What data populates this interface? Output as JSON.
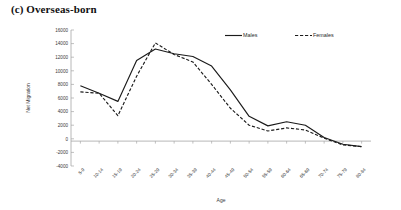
{
  "figure": {
    "title": "(c) Overseas-born",
    "background_color": "#ffffff",
    "line_color": "#1b1b1b",
    "axis_color": "#a6a6a6"
  },
  "axes": {
    "y_title": "Net Migration",
    "x_title": "Age",
    "y_ticks": [
      "16000",
      "14000",
      "12000",
      "10000",
      "8000",
      "6000",
      "4000",
      "2000",
      "0",
      "-2000",
      "-4000"
    ]
  },
  "legend": {
    "position": "top-right",
    "entries": [
      {
        "label": "Males",
        "style": "solid",
        "name": "legend-males"
      },
      {
        "label": "Females",
        "style": "dashed",
        "name": "legend-females"
      }
    ]
  },
  "chart_data": {
    "type": "line",
    "title": "(c) Overseas-born",
    "xlabel": "Age",
    "ylabel": "Net Migration",
    "ylim": [
      -4000,
      16000
    ],
    "ytick_interval": 2000,
    "grid": false,
    "legend_position": "top-right",
    "categories": [
      "5-9",
      "10-14",
      "15-19",
      "20-24",
      "25-29",
      "30-34",
      "35-39",
      "40-44",
      "45-49",
      "50-54",
      "55-59",
      "60-64",
      "65-69",
      "70-74",
      "75-79",
      "80-84"
    ],
    "series": [
      {
        "name": "Males",
        "style": "solid",
        "values": [
          7800,
          6700,
          5500,
          11500,
          13200,
          12500,
          12100,
          10700,
          7200,
          3300,
          1900,
          2500,
          2000,
          200,
          -800,
          -1150
        ]
      },
      {
        "name": "Females",
        "style": "dashed",
        "values": [
          6900,
          6700,
          3400,
          9200,
          14100,
          12400,
          11300,
          8000,
          4500,
          2000,
          1150,
          1600,
          1300,
          100,
          -900,
          -1150
        ]
      }
    ]
  }
}
